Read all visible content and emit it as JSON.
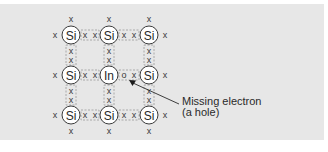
{
  "diagram": {
    "type": "crystal-lattice",
    "colors": {
      "background": "#e7e7e7",
      "atom_fill": "#ffffff",
      "atom_stroke": "#3a3a3a",
      "text": "#2a2a2a",
      "bond_box": "#9a9a9a"
    },
    "columns_x": [
      71,
      109,
      149
    ],
    "rows_y": [
      35,
      75,
      115
    ],
    "atoms": [
      {
        "row": 0,
        "col": 0,
        "label": "Si"
      },
      {
        "row": 0,
        "col": 1,
        "label": "Si"
      },
      {
        "row": 0,
        "col": 2,
        "label": "Si"
      },
      {
        "row": 1,
        "col": 0,
        "label": "Si"
      },
      {
        "row": 1,
        "col": 1,
        "label": "In"
      },
      {
        "row": 1,
        "col": 2,
        "label": "Si"
      },
      {
        "row": 2,
        "col": 0,
        "label": "Si"
      },
      {
        "row": 2,
        "col": 1,
        "label": "Si"
      },
      {
        "row": 2,
        "col": 2,
        "label": "Si"
      }
    ],
    "electron_symbol": "x",
    "hole_symbol": "o",
    "callout": {
      "line1": "Missing electron",
      "line2": "(a hole)"
    }
  }
}
